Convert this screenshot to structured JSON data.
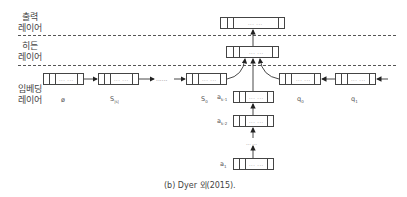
{
  "layers": {
    "output": [
      "출력",
      "레이어"
    ],
    "hidden": [
      "히든",
      "레이어"
    ],
    "embedding": [
      "임베딩",
      "레이어"
    ]
  },
  "cell_dots": "... ...",
  "nodes": {
    "embed_left": [
      "ø",
      "S",
      "S"
    ],
    "embed_left_sub": [
      "",
      "|s|",
      "0"
    ],
    "embed_right": [
      "q",
      "q"
    ],
    "embed_right_sub": [
      "0",
      "1"
    ],
    "stack": [
      "a",
      "a",
      "a"
    ],
    "stack_sub": [
      "k-1",
      "k-2",
      "1"
    ],
    "stack_gap": "... ..."
  },
  "chain_dots": "......",
  "caption": "(b) Dyer 외(2015)."
}
